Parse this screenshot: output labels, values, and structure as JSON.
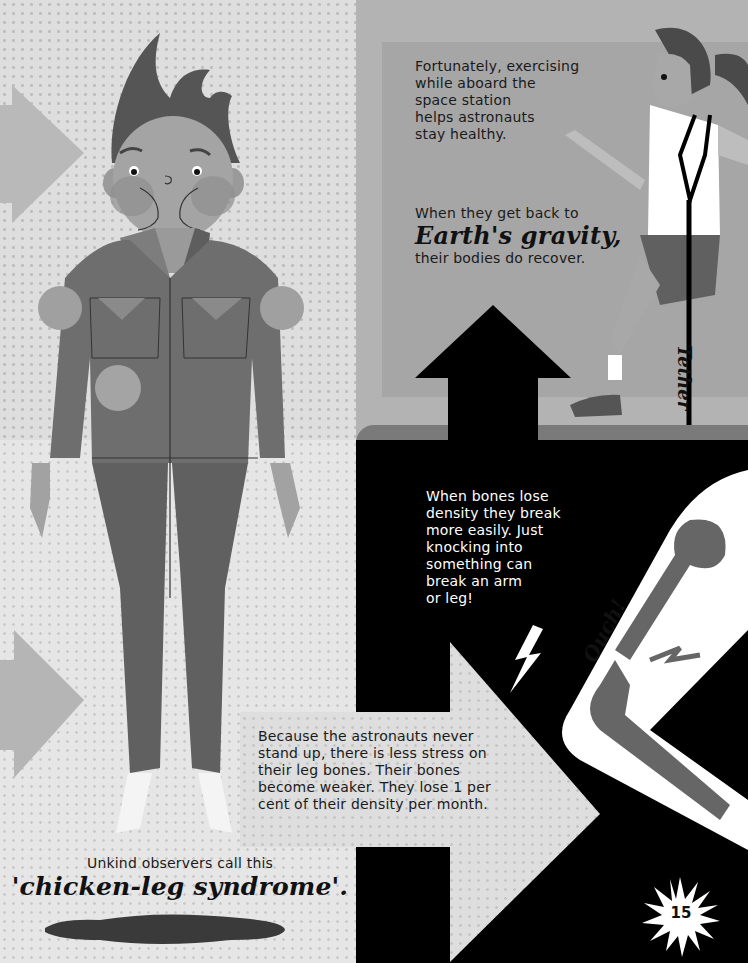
{
  "page": {
    "page_number": "15",
    "colors": {
      "background_dots": "#dedede",
      "panel_gray": "#a8a8a8",
      "black_panel": "#000000",
      "text_dark": "#1a1a1a",
      "text_light": "#ffffff"
    }
  },
  "exercise_panel": {
    "text_lines": [
      "Fortunately, exercising",
      "while aboard the",
      "space station",
      "helps astronauts",
      "stay healthy."
    ],
    "recover_intro": "When they get back to",
    "recover_highlight": "Earth's gravity,",
    "recover_outro": "their bodies do recover.",
    "tether_label": "Tether"
  },
  "bones_panel": {
    "text_lines": [
      "When bones lose",
      "density they break",
      "more easily. Just",
      "knocking into",
      "something can",
      "break an arm",
      "or leg!"
    ],
    "exclamation": "Ouch!"
  },
  "stress_callout": {
    "text_lines": [
      "Because the astronauts never",
      "stand up, there is less stress on",
      "their leg bones. Their bones",
      "become weaker. They lose 1 per",
      "cent of their density per month."
    ]
  },
  "caption": {
    "intro": "Unkind observers call this",
    "highlight": "'chicken-leg syndrome'."
  },
  "icons": {
    "page_badge": "starburst-icon",
    "arrow_up": "arrow-up-icon",
    "arrow_right": "arrow-right-icon"
  }
}
